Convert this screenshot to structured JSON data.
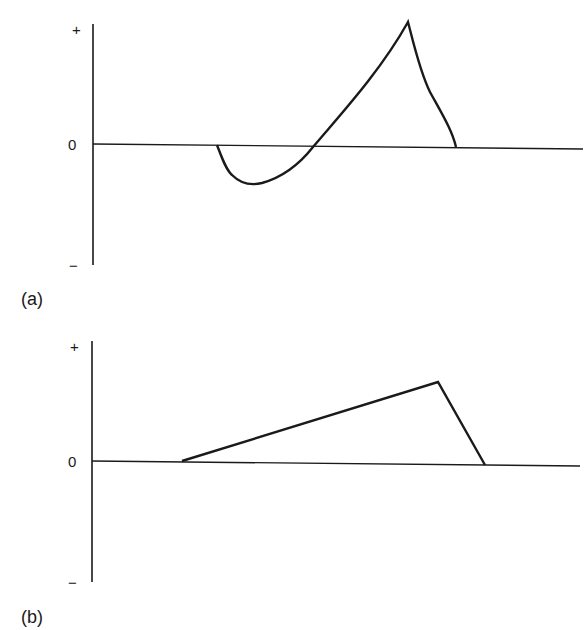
{
  "panels": [
    {
      "id": "a",
      "label": "(a)",
      "y_ticks": {
        "plus": "+",
        "zero": "0",
        "minus": "−"
      },
      "curve": "smooth waveform: baseline, negative dip, then rising to sharp positive peak, returning to zero"
    },
    {
      "id": "b",
      "label": "(b)",
      "y_ticks": {
        "plus": "+",
        "zero": "0",
        "minus": "−"
      },
      "curve": "triangular waveform: linear rise from zero to positive peak, then steeper linear fall to zero"
    }
  ],
  "colors": {
    "line": "#1a1a1a",
    "background": "#ffffff"
  }
}
